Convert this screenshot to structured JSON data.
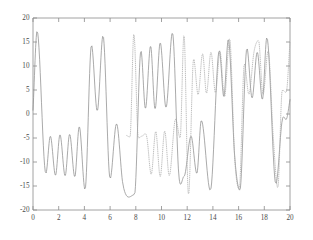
{
  "figure": {
    "background_color": "#ffffff",
    "axis_color": "#8a8a8a",
    "tick_label_color": "#4a4a4a"
  },
  "chart_data": {
    "type": "line",
    "title": "",
    "subtitle": "",
    "xlabel": "",
    "ylabel": "",
    "xlim": [
      0,
      20
    ],
    "ylim": [
      -20,
      20
    ],
    "grid": false,
    "legend": null,
    "legend_position": "none",
    "xticks": [
      0,
      2,
      4,
      6,
      8,
      10,
      12,
      14,
      16,
      18,
      20
    ],
    "xtick_labels": [
      "0",
      "2",
      "4",
      "6",
      "8",
      "10",
      "12",
      "14",
      "16",
      "18",
      "20"
    ],
    "yticks": [
      -20,
      -15,
      -10,
      -5,
      0,
      5,
      10,
      15,
      20
    ],
    "ytick_labels": [
      "-20",
      "-15",
      "-10",
      "-5",
      "0",
      "5",
      "10",
      "15",
      "20"
    ],
    "series": [
      {
        "name": "solid-curve",
        "style": "solid",
        "color": "#8d8d8d",
        "x_start": 0.0,
        "x_end": 20.0,
        "model": "amplitude_modulated_oscillation",
        "description": "Beating waveform: envelope amplitude grows in bursts with nodes near x=0.2, 3.2, 7.0, 11.0, 13.5, 16.5, 19.5; carrier period about 1.1 units; peak magnitude about 17",
        "params": {
          "carrier_freq": 5.6,
          "envelope_freq": 0.78,
          "amplitude": 17.0,
          "phase": 0.0
        },
        "notable_points": [
          {
            "x": 0.0,
            "y": 0.8
          },
          {
            "x": 0.32,
            "y": 17.3
          },
          {
            "x": 1.0,
            "y": -12.4
          },
          {
            "x": 1.35,
            "y": -4.6
          },
          {
            "x": 1.75,
            "y": -12.8
          },
          {
            "x": 2.1,
            "y": -4.3
          },
          {
            "x": 2.5,
            "y": -12.9
          },
          {
            "x": 2.85,
            "y": -4.2
          },
          {
            "x": 3.25,
            "y": -13.1
          },
          {
            "x": 3.6,
            "y": -2.6
          },
          {
            "x": 4.05,
            "y": -15.8
          },
          {
            "x": 4.55,
            "y": 14.4
          },
          {
            "x": 5.0,
            "y": 0.6
          },
          {
            "x": 5.45,
            "y": 16.4
          },
          {
            "x": 6.0,
            "y": -13.5
          },
          {
            "x": 6.5,
            "y": -2.0
          },
          {
            "x": 7.0,
            "y": -14.7
          },
          {
            "x": 7.9,
            "y": -16.8
          },
          {
            "x": 8.4,
            "y": 13.2
          },
          {
            "x": 8.75,
            "y": 1.1
          },
          {
            "x": 9.15,
            "y": 14.2
          },
          {
            "x": 9.5,
            "y": 1.0
          },
          {
            "x": 9.9,
            "y": 14.9
          },
          {
            "x": 10.35,
            "y": 1.3
          },
          {
            "x": 10.85,
            "y": 17.0
          },
          {
            "x": 11.35,
            "y": -12.8
          },
          {
            "x": 11.75,
            "y": -13.0
          },
          {
            "x": 12.3,
            "y": -4.6
          },
          {
            "x": 12.75,
            "y": -12.4
          },
          {
            "x": 13.1,
            "y": -1.3
          },
          {
            "x": 13.8,
            "y": -16.0
          },
          {
            "x": 14.5,
            "y": 13.3
          },
          {
            "x": 14.85,
            "y": 3.6
          },
          {
            "x": 15.2,
            "y": 15.6
          },
          {
            "x": 15.7,
            "y": -9.0
          },
          {
            "x": 16.1,
            "y": -15.9
          },
          {
            "x": 16.65,
            "y": 13.7
          },
          {
            "x": 17.05,
            "y": 3.3
          },
          {
            "x": 17.45,
            "y": 12.9
          },
          {
            "x": 17.85,
            "y": 3.0
          },
          {
            "x": 18.2,
            "y": 16.0
          },
          {
            "x": 18.9,
            "y": -14.6
          },
          {
            "x": 19.4,
            "y": -1.2
          },
          {
            "x": 19.75,
            "y": -0.9
          },
          {
            "x": 20.0,
            "y": 3.0
          }
        ]
      },
      {
        "name": "dotted-curve",
        "style": "dotted",
        "color": "#a8a8a8",
        "x_start": 7.3,
        "x_end": 20.0,
        "model": "higher_frequency_amplitude_modulated_oscillation",
        "description": "Dotted beating waveform appearing from about x=7.3 onward; higher carrier frequency than the solid curve, peak magnitude about 17, nodes near x=10.6, 13.0, 16.0, 19.0",
        "params": {
          "carrier_freq": 7.4,
          "envelope_freq": 0.85,
          "amplitude": 17.0,
          "phase": 1.2
        },
        "notable_points": [
          {
            "x": 7.3,
            "y": -4.5
          },
          {
            "x": 7.55,
            "y": -4.8
          },
          {
            "x": 7.85,
            "y": 16.8
          },
          {
            "x": 8.2,
            "y": -5.0
          },
          {
            "x": 8.5,
            "y": -4.6
          },
          {
            "x": 8.85,
            "y": -4.7
          },
          {
            "x": 9.2,
            "y": -12.6
          },
          {
            "x": 9.55,
            "y": -3.6
          },
          {
            "x": 9.9,
            "y": -13.1
          },
          {
            "x": 10.25,
            "y": -3.5
          },
          {
            "x": 10.6,
            "y": -12.9
          },
          {
            "x": 11.1,
            "y": -1.0
          },
          {
            "x": 11.45,
            "y": -5.0
          },
          {
            "x": 11.75,
            "y": 16.6
          },
          {
            "x": 12.1,
            "y": -17.0
          },
          {
            "x": 12.5,
            "y": 11.5
          },
          {
            "x": 12.85,
            "y": 4.0
          },
          {
            "x": 13.2,
            "y": 12.6
          },
          {
            "x": 13.5,
            "y": 4.3
          },
          {
            "x": 13.85,
            "y": 12.9
          },
          {
            "x": 14.2,
            "y": 4.4
          },
          {
            "x": 14.55,
            "y": 13.0
          },
          {
            "x": 14.9,
            "y": 3.5
          },
          {
            "x": 15.3,
            "y": 15.8
          },
          {
            "x": 15.7,
            "y": -9.5
          },
          {
            "x": 16.05,
            "y": -15.6
          },
          {
            "x": 16.45,
            "y": 10.5
          },
          {
            "x": 16.8,
            "y": 4.1
          },
          {
            "x": 17.2,
            "y": 13.0
          },
          {
            "x": 17.55,
            "y": 15.3
          },
          {
            "x": 17.9,
            "y": 4.0
          },
          {
            "x": 18.3,
            "y": 13.2
          },
          {
            "x": 18.7,
            "y": -5.0
          },
          {
            "x": 19.05,
            "y": -15.4
          },
          {
            "x": 19.4,
            "y": 5.0
          },
          {
            "x": 19.7,
            "y": 4.5
          },
          {
            "x": 20.0,
            "y": 15.0
          }
        ]
      }
    ]
  }
}
